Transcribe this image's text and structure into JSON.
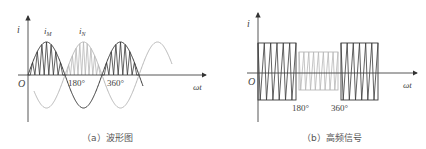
{
  "colors": {
    "dark": "#3a3a3a",
    "light": "#b8b8b8",
    "axis": "#444444",
    "text": "#555555"
  },
  "panel_a": {
    "caption": "（a）波形图",
    "y_label": "i",
    "x_label": "ωt",
    "origin_label": "O",
    "ticks": [
      "180°",
      "360°"
    ],
    "curve_labels": {
      "m": "i",
      "m_sub": "M",
      "n": "i",
      "n_sub": "N"
    }
  },
  "panel_b": {
    "caption": "（b）高频信号",
    "y_label": "i",
    "x_label": "ωt",
    "origin_label": "O",
    "ticks": [
      "180°",
      "360°"
    ]
  }
}
